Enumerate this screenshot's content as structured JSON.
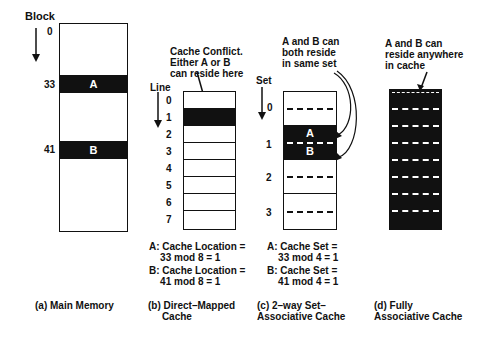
{
  "panel_a": {
    "axis_label": "Block",
    "block_labels": [
      "0",
      "33",
      "41"
    ],
    "blocks": [
      "A",
      "B"
    ],
    "caption": "(a) Main Memory"
  },
  "panel_b": {
    "annotation": "Cache Conflict.\nEither A or B\ncan reside here",
    "axis_label": "Line",
    "line_labels": [
      "0",
      "1",
      "2",
      "3",
      "4",
      "5",
      "6",
      "7"
    ],
    "calc_a": "A: Cache Location =\n    33 mod 8 = 1",
    "calc_b": "B: Cache Location =\n    41 mod 8 = 1",
    "caption": "(b) Direct–Mapped\n     Cache"
  },
  "panel_c": {
    "annotation": "A and B can\nboth reside\nin same set",
    "axis_label": "Set",
    "set_labels": [
      "0",
      "1",
      "2",
      "3"
    ],
    "blocks": [
      "A",
      "B"
    ],
    "calc_a": "A: Cache Set =\n    33 mod 4 = 1",
    "calc_b": "B: Cache Set =\n    41 mod 4 = 1",
    "caption": "(c) 2–way Set–\nAssociative Cache"
  },
  "panel_d": {
    "annotation": "A and B can\nreside anywhere\nin cache",
    "caption": "(d) Fully\nAssociative Cache"
  }
}
